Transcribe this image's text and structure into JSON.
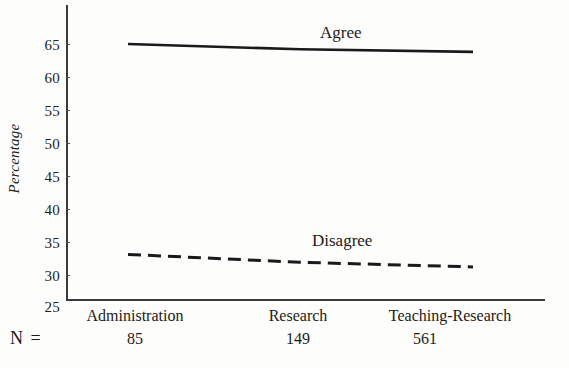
{
  "chart_data": {
    "type": "line",
    "title": "",
    "xlabel": "",
    "ylabel": "Percentage",
    "categories": [
      "Administration",
      "Research",
      "Teaching-Research"
    ],
    "x": [
      0,
      1,
      2
    ],
    "ylim": [
      25,
      65
    ],
    "yticks": [
      25,
      30,
      35,
      40,
      45,
      50,
      55,
      60,
      65
    ],
    "ytick_labels": [
      "25",
      "30",
      "35",
      "40",
      "45",
      "50",
      "55",
      "60",
      "65"
    ],
    "grid": false,
    "legend_position": "inline-labels",
    "series": [
      {
        "name": "Agree",
        "label": "Agree",
        "style": "solid",
        "values": [
          65.0,
          64.2,
          63.8
        ]
      },
      {
        "name": "Disagree",
        "label": "Disagree",
        "style": "dashed",
        "values": [
          33.0,
          31.8,
          31.1
        ]
      }
    ],
    "n_row": {
      "title": "N =",
      "values": [
        "85",
        "149",
        "561"
      ]
    },
    "colors": {
      "line": "#1a1a1a",
      "axis": "#3b3b3b",
      "background": "#fdfdfc"
    }
  },
  "axis": {
    "y_label": "Percentage",
    "ticks": [
      "65",
      "60",
      "55",
      "50",
      "45",
      "40",
      "35",
      "30",
      "25"
    ]
  },
  "series_labels": {
    "agree": "Agree",
    "disagree": "Disagree"
  },
  "categories": {
    "c0": "Administration",
    "c1": "Research",
    "c2": "Teaching-Research"
  },
  "n_row": {
    "title": "N =",
    "v0": "85",
    "v1": "149",
    "v2": "561"
  }
}
